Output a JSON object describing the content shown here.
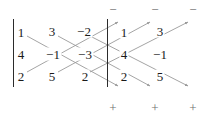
{
  "figure": {
    "kind": "sarrus-rule-determinant-diagram",
    "matrix": {
      "rows": 3,
      "cols": 3,
      "values": [
        [
          "1",
          "3",
          "-2"
        ],
        [
          "4",
          "-1",
          "-3"
        ],
        [
          "2",
          "5",
          "2"
        ]
      ]
    },
    "repeated_columns": {
      "count": 2,
      "values": [
        [
          "1",
          "3"
        ],
        [
          "4",
          "-1"
        ],
        [
          "2",
          "5"
        ]
      ]
    },
    "cells": [
      {
        "id": "r1c1",
        "text": "1",
        "x": 21,
        "y": 32
      },
      {
        "id": "r1c2",
        "text": "3",
        "x": 52,
        "y": 31
      },
      {
        "id": "r1c3",
        "text": "−2",
        "x": 84,
        "y": 31
      },
      {
        "id": "r1c4",
        "text": "1",
        "x": 124,
        "y": 32
      },
      {
        "id": "r1c5",
        "text": "3",
        "x": 160,
        "y": 31
      },
      {
        "id": "r2c1",
        "text": "4",
        "x": 21,
        "y": 54
      },
      {
        "id": "r2c2",
        "text": "−1",
        "x": 53,
        "y": 54
      },
      {
        "id": "r2c3",
        "text": "−3",
        "x": 85,
        "y": 54
      },
      {
        "id": "r2c4",
        "text": "4",
        "x": 124,
        "y": 54
      },
      {
        "id": "r2c5",
        "text": "−1",
        "x": 160,
        "y": 54
      },
      {
        "id": "r3c1",
        "text": "2",
        "x": 21,
        "y": 76
      },
      {
        "id": "r3c2",
        "text": "5",
        "x": 52,
        "y": 76
      },
      {
        "id": "r3c3",
        "text": "2",
        "x": 85,
        "y": 76
      },
      {
        "id": "r3c4",
        "text": "2",
        "x": 124,
        "y": 76
      },
      {
        "id": "r3c5",
        "text": "5",
        "x": 160,
        "y": 76
      }
    ],
    "determinant_bars": [
      {
        "id": "left-bar",
        "x": 13,
        "y": 19,
        "height": 68
      },
      {
        "id": "right-bar",
        "x": 107,
        "y": 19,
        "height": 68
      }
    ],
    "top_signs": [
      {
        "id": "minus-1",
        "text": "−",
        "x": 113,
        "y": 9
      },
      {
        "id": "minus-2",
        "text": "−",
        "x": 155,
        "y": 9
      },
      {
        "id": "minus-3",
        "text": "−",
        "x": 193,
        "y": 9
      }
    ],
    "bottom_signs": [
      {
        "id": "plus-1",
        "text": "+",
        "x": 113,
        "y": 107
      },
      {
        "id": "plus-2",
        "text": "+",
        "x": 155,
        "y": 107
      },
      {
        "id": "plus-3",
        "text": "+",
        "x": 193,
        "y": 107
      }
    ],
    "downward_diagonals": [
      {
        "id": "down-1",
        "from": [
          27,
          36
        ],
        "to": [
          118,
          86
        ],
        "sign": "+"
      },
      {
        "id": "down-2",
        "from": [
          58,
          36
        ],
        "to": [
          150,
          86
        ],
        "sign": "+"
      },
      {
        "id": "down-3",
        "from": [
          90,
          36
        ],
        "to": [
          188,
          86
        ],
        "sign": "+"
      }
    ],
    "upward_diagonals": [
      {
        "id": "up-1",
        "from": [
          27,
          72
        ],
        "to": [
          118,
          22
        ],
        "sign": "−"
      },
      {
        "id": "up-2",
        "from": [
          58,
          72
        ],
        "to": [
          150,
          22
        ],
        "sign": "−"
      },
      {
        "id": "up-3",
        "from": [
          90,
          72
        ],
        "to": [
          188,
          22
        ],
        "sign": "−"
      }
    ],
    "colors": {
      "number": "#1a1a1a",
      "bar": "#2b2b2b",
      "arrow": "#9a9a9a",
      "sign": "#6e6e6e",
      "background": "#ffffff"
    }
  }
}
